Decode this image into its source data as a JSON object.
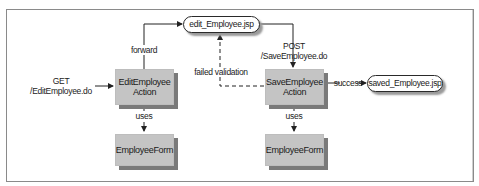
{
  "diagram": {
    "nodes": {
      "edit_action": {
        "line1": "EditEmployee",
        "line2": "Action"
      },
      "save_action": {
        "line1": "SaveEmployee",
        "line2": "Action"
      },
      "edit_form": {
        "label": "EmployeeForm"
      },
      "save_form": {
        "label": "EmployeeForm"
      },
      "edit_jsp": {
        "label": "edit_Employee.jsp"
      },
      "saved_jsp": {
        "label": "saved_Employee.jsp"
      }
    },
    "edges": {
      "get_request": {
        "line1": "GET",
        "line2": "/EditEmployee.do"
      },
      "forward": {
        "label": "forward"
      },
      "post_request": {
        "line1": "POST",
        "line2": "/SaveEmployee.do"
      },
      "failed_validation": {
        "label": "failed validation"
      },
      "success": {
        "label": "success"
      },
      "edit_uses": {
        "label": "uses"
      },
      "save_uses": {
        "label": "uses"
      }
    },
    "colors": {
      "box_fill": "#c4c4c4",
      "box_shadow": "#7a7a7a",
      "line": "#222222",
      "frame": "#8a8a8a"
    }
  }
}
